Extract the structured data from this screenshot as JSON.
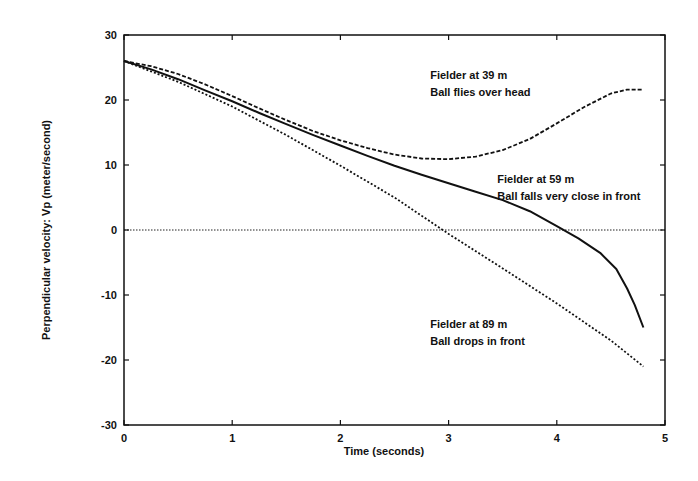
{
  "chart_data": {
    "type": "line",
    "title": "",
    "xlabel": "Time (seconds)",
    "ylabel": "Perpendicular velocity: Vp (meter/second)",
    "xlim": [
      0,
      5
    ],
    "ylim": [
      -30,
      30
    ],
    "xticks": [
      "0",
      "1",
      "2",
      "3",
      "4",
      "5"
    ],
    "yticks": [
      "30",
      "20",
      "10",
      "0",
      "-10",
      "-20",
      "-30"
    ],
    "grid": false,
    "legend": "none (inline annotations)",
    "reference_line": {
      "y": 0,
      "style": "dotted"
    },
    "series": [
      {
        "name": "Fielder at 39 m",
        "note": "Ball flies over head",
        "style": "dashed",
        "x": [
          0,
          0.25,
          0.5,
          0.75,
          1.0,
          1.25,
          1.5,
          1.75,
          2.0,
          2.25,
          2.5,
          2.75,
          3.0,
          3.25,
          3.5,
          3.75,
          4.0,
          4.25,
          4.5,
          4.65,
          4.8
        ],
        "y": [
          26,
          25.2,
          24,
          22.4,
          20.6,
          18.7,
          16.9,
          15.2,
          13.8,
          12.6,
          11.6,
          11.0,
          10.9,
          11.3,
          12.3,
          14.0,
          16.4,
          18.9,
          21.0,
          21.6,
          21.6
        ]
      },
      {
        "name": "Fielder at 59 m",
        "note": "Ball falls very close in front",
        "style": "solid",
        "x": [
          0,
          0.25,
          0.5,
          0.75,
          1.0,
          1.25,
          1.5,
          1.75,
          2.0,
          2.25,
          2.5,
          2.75,
          3.0,
          3.25,
          3.5,
          3.75,
          4.0,
          4.2,
          4.4,
          4.55,
          4.65,
          4.72,
          4.8
        ],
        "y": [
          26,
          24.7,
          23.2,
          21.5,
          19.8,
          18.0,
          16.3,
          14.6,
          13.0,
          11.4,
          9.9,
          8.5,
          7.2,
          5.9,
          4.6,
          2.9,
          0.6,
          -1.3,
          -3.5,
          -6.0,
          -9.0,
          -11.5,
          -15
        ]
      },
      {
        "name": "Fielder at 89 m",
        "note": "Ball drops in front",
        "style": "dotted",
        "x": [
          0,
          0.5,
          1.0,
          1.5,
          2.0,
          2.5,
          3.0,
          3.5,
          4.0,
          4.5,
          4.8
        ],
        "y": [
          26,
          22.8,
          19.0,
          14.6,
          9.9,
          5.0,
          -0.6,
          -5.9,
          -11.3,
          -17.0,
          -21.0
        ]
      }
    ],
    "annotations": [
      {
        "lines": [
          "Fielder at 39 m",
          "Ball flies over head"
        ],
        "x": 2.83,
        "y": 23.2
      },
      {
        "lines": [
          "Fielder at 59 m",
          "Ball falls very close in front"
        ],
        "x": 3.45,
        "y": 7.2
      },
      {
        "lines": [
          "Fielder at 89 m",
          "Ball drops in front"
        ],
        "x": 2.83,
        "y": -15.0
      }
    ]
  }
}
